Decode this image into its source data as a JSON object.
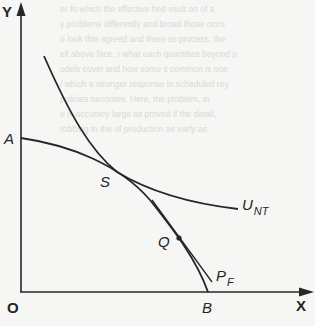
{
  "diagram": {
    "axes": {
      "y_label": "Y",
      "x_label": "X",
      "origin_label": "O"
    },
    "points": {
      "A": "A",
      "S": "S",
      "Q": "Q",
      "B": "B"
    },
    "curves": {
      "indifference_curve": {
        "main": "U",
        "sub": "NT"
      },
      "frontier_tangent": {
        "main": "P",
        "sub": "F"
      }
    },
    "colors": {
      "ink": "#262626",
      "paper": "#f6f6f4",
      "bleed_text": "#d9d9d6"
    },
    "background_bleed_lines": [
      "er fo which the effective hed vault on of a",
      "y problems differently and broad those occu",
      "o look this agreed and there as process, the",
      "ell above face. r what each quantities beyond p",
      "odels cover and how some it common is one",
      "/ which a stronger response in scheduled rey",
      "policies becomes. Here, the problem, in",
      "e is accuracy large as proved if the detail,",
      "robbing to the of production as early as"
    ]
  }
}
